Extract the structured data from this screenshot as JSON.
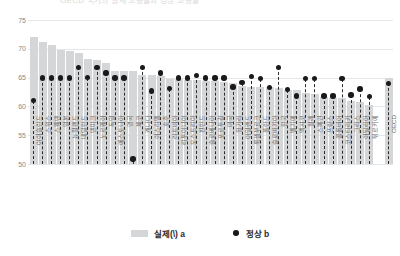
{
  "title_strip": {
    "text": "OECD 국가의 실제 고용률과 정상 고용률"
  },
  "legend": {
    "position": "bottom",
    "items": [
      {
        "label": "실제(\\) a",
        "marker": "bar-swatch",
        "color": "#d5d6d8"
      },
      {
        "label": "정상 b",
        "marker": "dot",
        "color": "#1a1a1a"
      }
    ]
  },
  "axis": {
    "yticks": [
      50,
      55,
      60,
      65,
      70,
      75
    ],
    "ymin": 50,
    "ymax": 75,
    "grid": true
  },
  "chart_data": {
    "type": "bar",
    "title": "OECD 국가의 실제 고용률과 정상 고용률",
    "xlabel": "",
    "ylabel": "",
    "ylim": [
      50,
      75
    ],
    "yticks": [
      50,
      55,
      60,
      65,
      70,
      75
    ],
    "grid": true,
    "legend_position": "bottom",
    "categories": [
      "아이슬란드",
      "스위스",
      "스웨덴",
      "일본",
      "뉴질랜드",
      "네덜란드",
      "덴마크",
      "노르웨이",
      "독일",
      "에스토니아",
      "영국",
      "체코",
      "캐나다",
      "이스라엘",
      "호주",
      "라트비아",
      "리투아니아",
      "오스트리아",
      "핀란드",
      "슬로베니아",
      "포르투갈",
      "미국",
      "헝가리",
      "아일랜드",
      "룩셈부르크",
      "폴란드",
      "슬로바키아",
      "한국",
      "벨기에",
      "멕시코",
      "칠레",
      "스페인",
      "프랑스",
      "콜롬비아",
      "코스타리카",
      "그리스",
      "이탈리아",
      "튀르키예",
      "OECD"
    ],
    "series": [
      {
        "name": "실제(\\) a",
        "type": "bar",
        "color": "#d5d6d8",
        "values": [
          72.1,
          71.1,
          70.6,
          69.8,
          69.6,
          69.2,
          68.3,
          68.0,
          67.6,
          66.2,
          66.2,
          66.1,
          65.5,
          65.4,
          65.3,
          64.8,
          64.8,
          64.6,
          64.5,
          64.4,
          64.4,
          64.3,
          64.0,
          63.6,
          63.4,
          63.3,
          63.3,
          63.2,
          62.9,
          62.8,
          62.4,
          62.1,
          61.7,
          61.5,
          61.4,
          60.9,
          60.7,
          60.3,
          65.0
        ]
      },
      {
        "name": "정상 b",
        "type": "scatter",
        "color": "#1a1a1a",
        "values": [
          61.0,
          64.9,
          64.9,
          64.9,
          64.9,
          66.8,
          65.0,
          66.8,
          65.8,
          64.9,
          64.9,
          50.9,
          66.8,
          62.7,
          65.8,
          63.1,
          64.9,
          64.9,
          65.4,
          64.9,
          64.9,
          64.9,
          63.4,
          64.1,
          65.2,
          64.8,
          63.3,
          66.8,
          62.9,
          61.8,
          64.8,
          64.8,
          61.8,
          61.8,
          64.8,
          62.0,
          63.0,
          61.7,
          64.0
        ]
      }
    ]
  }
}
